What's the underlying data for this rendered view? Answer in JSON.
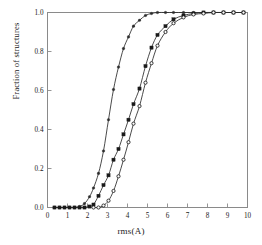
{
  "chart_data": {
    "type": "line",
    "title": "",
    "subtitle": "",
    "xlabel": "rms(A)",
    "ylabel": "Fraction of structures",
    "xlim": [
      0,
      10
    ],
    "ylim": [
      0,
      1.0
    ],
    "xticks": [
      0,
      1,
      2,
      3,
      4,
      5,
      6,
      7,
      8,
      9,
      10
    ],
    "xticklabels": [
      "0",
      "1",
      "2",
      "3",
      "4",
      "5",
      "6",
      "7",
      "8",
      "9",
      "10"
    ],
    "yticks": [
      0.0,
      0.2,
      0.4,
      0.6,
      0.8,
      1.0
    ],
    "yticklabels": [
      "0.0",
      "0.2",
      "0.4",
      "0.6",
      "0.8",
      "1.0"
    ],
    "grid": false,
    "legend": false,
    "legend_position": "none",
    "frame": "box",
    "series": [
      {
        "name": "curve-1",
        "marker": "filled-circle",
        "marker_size": 2.6,
        "color": "#2b2b2b",
        "x": [
          0.35,
          0.6,
          0.85,
          1.1,
          1.35,
          1.6,
          1.85,
          2.1,
          2.3,
          2.55,
          2.8,
          3.05,
          3.3,
          3.55,
          3.8,
          4.05,
          4.3,
          4.6,
          4.9,
          5.2,
          5.5,
          5.9,
          6.3,
          6.8,
          7.3,
          7.8,
          8.3,
          8.8,
          9.3,
          9.8
        ],
        "y": [
          0.0,
          0.0,
          0.0,
          0.0,
          0.0,
          0.005,
          0.02,
          0.055,
          0.1,
          0.175,
          0.29,
          0.45,
          0.605,
          0.72,
          0.815,
          0.875,
          0.93,
          0.96,
          0.985,
          0.995,
          1.0,
          1.0,
          1.0,
          1.0,
          1.0,
          1.0,
          1.0,
          1.0,
          1.0,
          1.0
        ]
      },
      {
        "name": "curve-2",
        "marker": "filled-square",
        "marker_size": 3.2,
        "color": "#1a1a1a",
        "x": [
          0.35,
          0.6,
          0.85,
          1.1,
          1.35,
          1.6,
          1.85,
          2.1,
          2.3,
          2.55,
          2.8,
          3.05,
          3.3,
          3.55,
          3.8,
          4.05,
          4.3,
          4.6,
          4.9,
          5.2,
          5.5,
          5.9,
          6.3,
          6.8,
          7.3,
          7.8,
          8.3,
          8.8,
          9.3,
          9.8
        ],
        "y": [
          0.0,
          0.0,
          0.0,
          0.0,
          0.0,
          0.0,
          0.0,
          0.005,
          0.015,
          0.06,
          0.115,
          0.165,
          0.245,
          0.3,
          0.375,
          0.45,
          0.53,
          0.61,
          0.725,
          0.82,
          0.885,
          0.93,
          0.965,
          0.985,
          0.995,
          1.0,
          1.0,
          1.0,
          1.0,
          1.0
        ]
      },
      {
        "name": "curve-3",
        "marker": "open-circle",
        "marker_size": 3.2,
        "color": "#1a1a1a",
        "x": [
          2.3,
          2.55,
          2.8,
          3.05,
          3.3,
          3.55,
          3.8,
          4.05,
          4.3,
          4.6,
          4.9,
          5.2,
          5.5,
          5.9,
          6.3,
          6.8,
          7.3,
          7.8,
          8.3,
          8.8,
          9.3,
          9.8
        ],
        "y": [
          0.0,
          0.0,
          0.01,
          0.035,
          0.085,
          0.16,
          0.245,
          0.335,
          0.43,
          0.52,
          0.64,
          0.74,
          0.83,
          0.9,
          0.945,
          0.975,
          0.99,
          0.995,
          1.0,
          1.0,
          1.0,
          1.0
        ]
      }
    ],
    "baseline_markers": {
      "name": "zero-baseline-points",
      "x": [
        0.35,
        0.6,
        0.85,
        1.1,
        1.35,
        1.6,
        1.85,
        2.1
      ],
      "y": 0.0
    }
  }
}
